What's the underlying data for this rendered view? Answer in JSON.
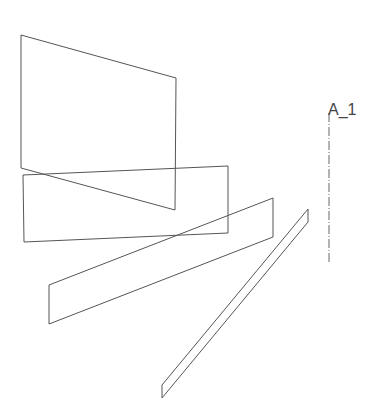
{
  "diagram": {
    "axis": {
      "label": "A_1",
      "x": 329,
      "y1": 113,
      "y2": 262,
      "label_pos": {
        "x": 328,
        "y": 101
      }
    },
    "planes": [
      {
        "name": "plane-1",
        "points": "21,35 176,78 175,210 21,168"
      },
      {
        "name": "plane-2",
        "points": "23,175 228,166 228,233 24,242"
      },
      {
        "name": "plane-3",
        "points": "49,285 273,198 273,237 49,324"
      },
      {
        "name": "plane-4",
        "points": "308,209 308,222 162,398 162,385"
      }
    ],
    "stroke_color": "#555555"
  }
}
